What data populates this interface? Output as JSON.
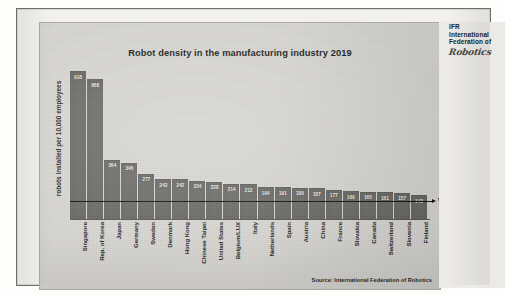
{
  "logo": {
    "abbr": "IFR",
    "line2": "International",
    "line3": "Federation of",
    "script": "Robotics"
  },
  "chart_data": {
    "type": "bar",
    "title": "Robot density in the manufacturing industry 2019",
    "xlabel": "",
    "ylabel": "robots installed per 10,000 employees",
    "ylim": [
      0,
      950
    ],
    "grid": false,
    "legend": false,
    "source": "Source: International Federation of Robotics",
    "reference_line": {
      "label": "World: 113",
      "value": 113
    },
    "categories": [
      "Singapore",
      "Rep. of Korea",
      "Japan",
      "Germany",
      "Sweden",
      "Denmark",
      "Hong Kong",
      "Chinese Taipei",
      "United States",
      "Belgium/LUX",
      "Italy",
      "Netherlands",
      "Spain",
      "Austria",
      "China",
      "France",
      "Slovakia",
      "Canada",
      "Switzerland",
      "Slovenia",
      "Finland"
    ],
    "values": [
      918,
      868,
      364,
      346,
      277,
      243,
      242,
      234,
      228,
      214,
      212,
      194,
      191,
      189,
      187,
      177,
      169,
      165,
      161,
      157,
      143
    ]
  },
  "colors": {
    "bar": "#6e6d69",
    "panel_background": "#d7d6d2",
    "reference_line": "#111110",
    "text": "#23221e"
  }
}
